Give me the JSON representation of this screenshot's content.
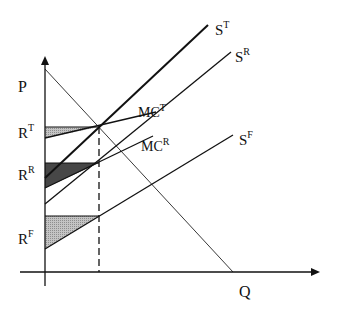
{
  "diagram": {
    "type": "economics supply-demand rent diagram",
    "axes": {
      "y_label": "P",
      "x_label": "Q"
    },
    "curves": [
      {
        "id": "ST",
        "base": "S",
        "sup": "T",
        "label": "ST"
      },
      {
        "id": "SR",
        "base": "S",
        "sup": "R",
        "label": "SR"
      },
      {
        "id": "SF",
        "base": "S",
        "sup": "F",
        "label": "SF"
      },
      {
        "id": "MCT",
        "base": "MC",
        "sup": "T",
        "label": "MCT"
      },
      {
        "id": "MCR",
        "base": "MC",
        "sup": "R",
        "label": "MCR"
      },
      {
        "id": "D",
        "label": "demand"
      }
    ],
    "rent_labels": [
      {
        "id": "RT",
        "base": "R",
        "sup": "T"
      },
      {
        "id": "RR",
        "base": "R",
        "sup": "R"
      },
      {
        "id": "RF",
        "base": "R",
        "sup": "F"
      }
    ],
    "colors": {
      "line": "#111111",
      "shade_light": "#a9a9a9",
      "shade_dark": "#4a4a4a",
      "shade_mid": "#b3b3b3"
    }
  }
}
